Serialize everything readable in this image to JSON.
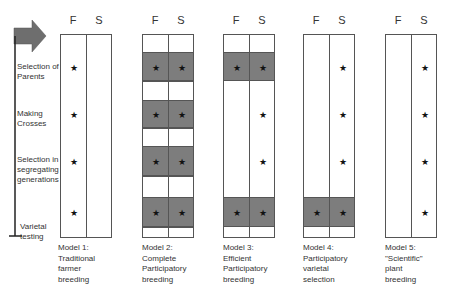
{
  "column_headers": {
    "farmer": "F",
    "scientist": "S"
  },
  "stages": [
    {
      "label": "Selection of Parents",
      "lines": [
        "Selection of",
        "Parents"
      ]
    },
    {
      "label": "Making Crosses",
      "lines": [
        "Making",
        "Crosses"
      ]
    },
    {
      "label": "Selection in segregating generations",
      "lines": [
        "Selection in",
        "segregating",
        "generations"
      ]
    },
    {
      "label": "Varietal testing",
      "lines": [
        "Varietal",
        "testing"
      ]
    }
  ],
  "star_glyph": "★",
  "colors": {
    "shaded_band": "#7d7d7d",
    "border": "#555555",
    "arrow": "#6e6e6e"
  },
  "models": [
    {
      "name": "Model 1",
      "lines": [
        "Model 1:",
        "Traditional",
        "farmer",
        "breeding"
      ],
      "stars": {
        "F": [
          true,
          true,
          true,
          true
        ],
        "S": [
          false,
          false,
          false,
          false
        ]
      },
      "shaded": [
        false,
        false,
        false,
        false
      ],
      "segmented": false
    },
    {
      "name": "Model 2",
      "lines": [
        "Model 2:",
        "Complete",
        "Participatory",
        "breeding"
      ],
      "stars": {
        "F": [
          true,
          true,
          true,
          true
        ],
        "S": [
          true,
          true,
          true,
          true
        ]
      },
      "shaded": [
        true,
        true,
        true,
        true
      ],
      "segmented": true
    },
    {
      "name": "Model 3",
      "lines": [
        "Model 3:",
        "Efficient",
        "Participatory",
        "breeding"
      ],
      "stars": {
        "F": [
          true,
          false,
          false,
          true
        ],
        "S": [
          true,
          true,
          true,
          true
        ]
      },
      "shaded": [
        true,
        false,
        false,
        true
      ],
      "segmented": false
    },
    {
      "name": "Model 4",
      "lines": [
        "Model 4:",
        "Participatory",
        "varietal",
        "selection"
      ],
      "stars": {
        "F": [
          false,
          false,
          false,
          true
        ],
        "S": [
          true,
          true,
          true,
          true
        ]
      },
      "shaded": [
        false,
        false,
        false,
        true
      ],
      "segmented": false
    },
    {
      "name": "Model 5",
      "lines": [
        "Model 5:",
        "\"Scientific\"",
        "plant",
        "breeding"
      ],
      "stars": {
        "F": [
          false,
          false,
          false,
          false
        ],
        "S": [
          true,
          true,
          true,
          true
        ]
      },
      "shaded": [
        false,
        false,
        false,
        false
      ],
      "segmented": false
    }
  ]
}
